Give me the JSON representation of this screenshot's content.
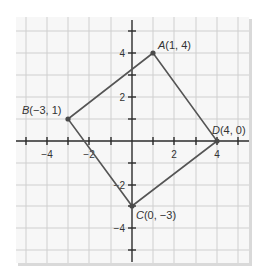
{
  "figure": {
    "type": "coordinate-plane",
    "x_range": [
      -5,
      5
    ],
    "y_range": [
      -5,
      5
    ],
    "x_tick_labels": [
      {
        "value": -4,
        "label": "−4"
      },
      {
        "value": -2,
        "label": "−2"
      },
      {
        "value": 2,
        "label": "2"
      },
      {
        "value": 4,
        "label": "4"
      }
    ],
    "y_tick_labels": [
      {
        "value": 4,
        "label": "4"
      },
      {
        "value": 2,
        "label": "2"
      },
      {
        "value": -2,
        "label": "−2"
      },
      {
        "value": -4,
        "label": "−4"
      }
    ],
    "grid": true,
    "points": [
      {
        "name": "A",
        "coords": "(1, 4)",
        "x": 1,
        "y": 4
      },
      {
        "name": "B",
        "coords": "(−3, 1)",
        "x": -3,
        "y": 1
      },
      {
        "name": "C",
        "coords": "(0, −3)",
        "x": 0,
        "y": -3
      },
      {
        "name": "D",
        "coords": "(4, 0)",
        "x": 4,
        "y": 0
      }
    ],
    "polygon": [
      "A",
      "D",
      "C",
      "B"
    ],
    "colors": {
      "background": "#f7f7f7",
      "grid": "#cfcfcf",
      "axis": "#2b2b2b",
      "edge": "#555555"
    }
  }
}
